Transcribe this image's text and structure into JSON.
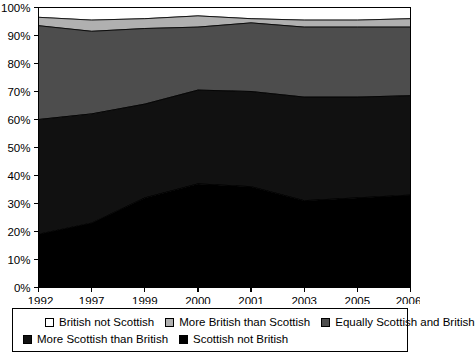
{
  "chart_data": {
    "type": "area",
    "stacked": true,
    "title": "",
    "subtitle": "",
    "xlabel": "",
    "ylabel": "",
    "grid": false,
    "legend_position": "bottom",
    "categories": [
      "1992",
      "1997",
      "1999",
      "2000",
      "2001",
      "2003",
      "2005",
      "2006"
    ],
    "ylim": [
      0,
      100
    ],
    "ytick_values": [
      0,
      10,
      20,
      30,
      40,
      50,
      60,
      70,
      80,
      90,
      100
    ],
    "ytick_labels": [
      "0%",
      "10%",
      "20%",
      "30%",
      "40%",
      "50%",
      "60%",
      "70%",
      "80%",
      "90%",
      "100%"
    ],
    "series": [
      {
        "name": "Scottish not British",
        "color": "#000000",
        "values": [
          19,
          23,
          32,
          37,
          36,
          31,
          32,
          33
        ]
      },
      {
        "name": "More Scottish than British",
        "color": "#111111",
        "values": [
          41,
          39,
          33.5,
          33.5,
          34,
          37,
          36,
          35.5
        ]
      },
      {
        "name": "Equally Scottish and British",
        "color": "#4d4d4d",
        "values": [
          33.5,
          29.5,
          27,
          22.5,
          24.5,
          25,
          25,
          24.5
        ]
      },
      {
        "name": "More British than Scottish",
        "color": "#b0b0b0",
        "values": [
          3,
          4,
          3.5,
          4,
          1.5,
          2.5,
          2.5,
          3
        ]
      },
      {
        "name": "British not Scottish",
        "color": "#ffffff",
        "values": [
          3.5,
          4.5,
          4,
          3,
          4,
          4.5,
          4.5,
          4
        ]
      }
    ]
  },
  "legend": {
    "rows": [
      [
        {
          "label": "British not Scottish",
          "color": "#ffffff"
        },
        {
          "label": "More British than Scottish",
          "color": "#b0b0b0"
        },
        {
          "label": "Equally Scottish and British",
          "color": "#4d4d4d"
        }
      ],
      [
        {
          "label": "More Scottish than British",
          "color": "#111111"
        },
        {
          "label": "Scottish not British",
          "color": "#000000"
        }
      ]
    ]
  }
}
